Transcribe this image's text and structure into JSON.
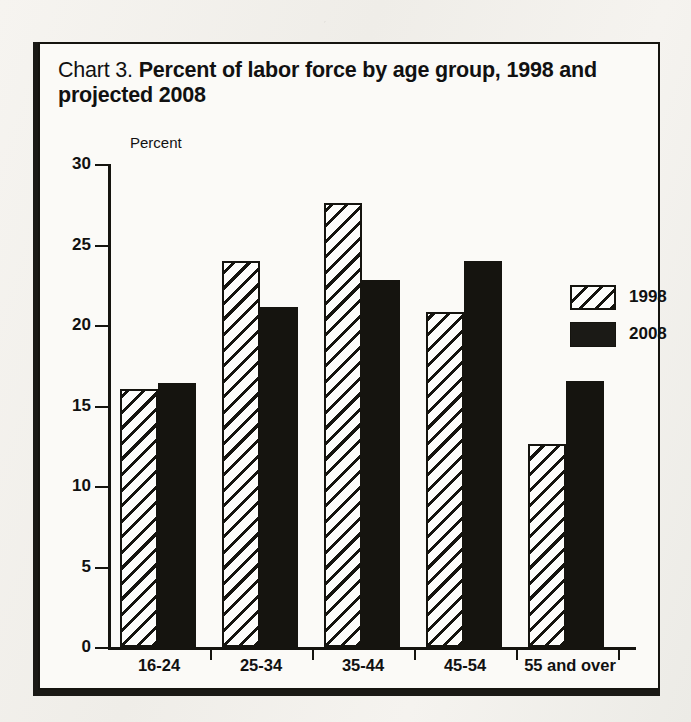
{
  "title": {
    "prefix": "Chart 3.",
    "main": "Percent of labor force by age group, 1998 and projected 2008"
  },
  "axis": {
    "y_label": "Percent",
    "y_ticks": [
      "0",
      "5",
      "10",
      "15",
      "20",
      "25",
      "30"
    ]
  },
  "legend": {
    "items": [
      {
        "label": "1998",
        "swatch": "hatched-diagonal"
      },
      {
        "label": "2008",
        "swatch": "solid-black"
      }
    ]
  },
  "chart_data": {
    "type": "bar",
    "title": "Chart 3. Percent of labor force by age group, 1998 and projected 2008",
    "xlabel": "",
    "ylabel": "Percent",
    "ylim": [
      0,
      30
    ],
    "yticks": [
      0,
      5,
      10,
      15,
      20,
      25,
      30
    ],
    "grid": false,
    "legend_position": "top-right",
    "categories": [
      "16-24",
      "25-34",
      "35-44",
      "45-54",
      "55 and over"
    ],
    "series": [
      {
        "name": "1998",
        "values": [
          16.0,
          24.0,
          27.6,
          20.8,
          12.6
        ]
      },
      {
        "name": "2008",
        "values": [
          16.4,
          21.1,
          22.8,
          24.0,
          16.5
        ]
      }
    ],
    "colors": {
      "1998": "#ffffff",
      "2008": "#15140f",
      "ink": "#15140f"
    }
  }
}
